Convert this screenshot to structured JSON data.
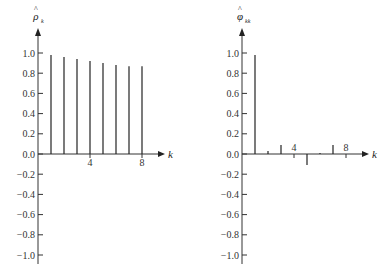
{
  "chart_data": [
    {
      "type": "bar",
      "title": "",
      "ylabel": "ρ̂_k",
      "ylabel_base": "ρ",
      "ylabel_sub": "k",
      "xlabel": "k",
      "ylim": [
        -1.0,
        1.0
      ],
      "yticks": [
        "1.0",
        "0.8",
        "0.6",
        "0.4",
        "0.2",
        "0.0",
        "−0.2",
        "−0.4",
        "−0.6",
        "−0.8",
        "−1.0"
      ],
      "xtick_labels": [
        {
          "k": 4,
          "label": "4"
        },
        {
          "k": 8,
          "label": "8"
        }
      ],
      "categories": [
        1,
        2,
        3,
        4,
        5,
        6,
        7,
        8
      ],
      "values": [
        0.98,
        0.96,
        0.94,
        0.92,
        0.9,
        0.88,
        0.87,
        0.87
      ],
      "grid": false
    },
    {
      "type": "bar",
      "title": "",
      "ylabel": "φ̂_kk",
      "ylabel_base": "φ",
      "ylabel_sub": "kk",
      "xlabel": "k",
      "ylim": [
        -1.0,
        1.0
      ],
      "yticks": [
        "1.0",
        "0.8",
        "0.6",
        "0.4",
        "0.2",
        "0.0",
        "−0.2",
        "−0.4",
        "−0.6",
        "−0.8",
        "−1.0"
      ],
      "xtick_labels": [
        {
          "k": 4,
          "label": "4"
        },
        {
          "k": 8,
          "label": "8"
        }
      ],
      "categories": [
        1,
        2,
        3,
        4,
        5,
        6,
        7,
        8
      ],
      "values": [
        0.98,
        0.03,
        0.09,
        0.0,
        -0.11,
        0.01,
        0.09,
        0.0
      ],
      "grid": false
    }
  ]
}
